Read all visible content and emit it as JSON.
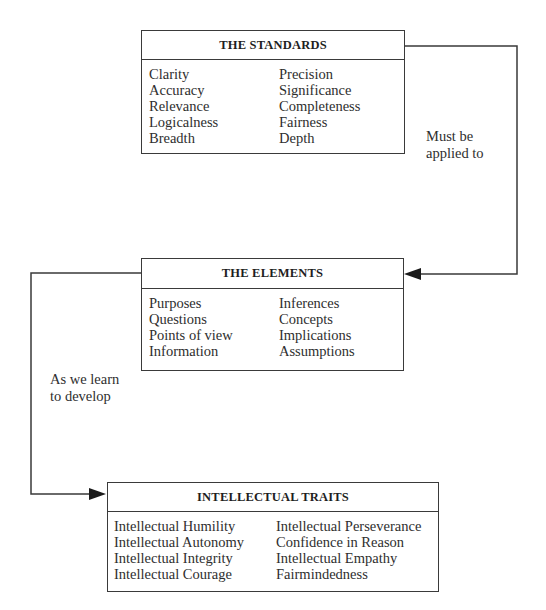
{
  "diagram": {
    "boxes": {
      "standards": {
        "title": "THE STANDARDS",
        "left_column": [
          "Clarity",
          "Accuracy",
          "Relevance",
          "Logicalness",
          "Breadth"
        ],
        "right_column": [
          "Precision",
          "Significance",
          "Completeness",
          "Fairness",
          "Depth"
        ]
      },
      "elements": {
        "title": "THE ELEMENTS",
        "left_column": [
          "Purposes",
          "Questions",
          "Points of view",
          "Information"
        ],
        "right_column": [
          "Inferences",
          "Concepts",
          "Implications",
          "Assumptions"
        ]
      },
      "traits": {
        "title": "INTELLECTUAL TRAITS",
        "left_column": [
          "Intellectual Humility",
          "Intellectual Autonomy",
          "Intellectual Integrity",
          "Intellectual Courage"
        ],
        "right_column": [
          "Intellectual Perseverance",
          "Confidence in Reason",
          "Intellectual Empathy",
          "Fairmindedness"
        ]
      }
    },
    "connectors": [
      {
        "from": "standards",
        "to": "elements",
        "label_lines": [
          "Must be",
          "applied to"
        ]
      },
      {
        "from": "elements",
        "to": "traits",
        "label_lines": [
          "As we learn",
          "to develop"
        ]
      }
    ],
    "colors": {
      "line": "#3a3a3a",
      "text": "#2e2e2e",
      "background": "#ffffff"
    }
  }
}
